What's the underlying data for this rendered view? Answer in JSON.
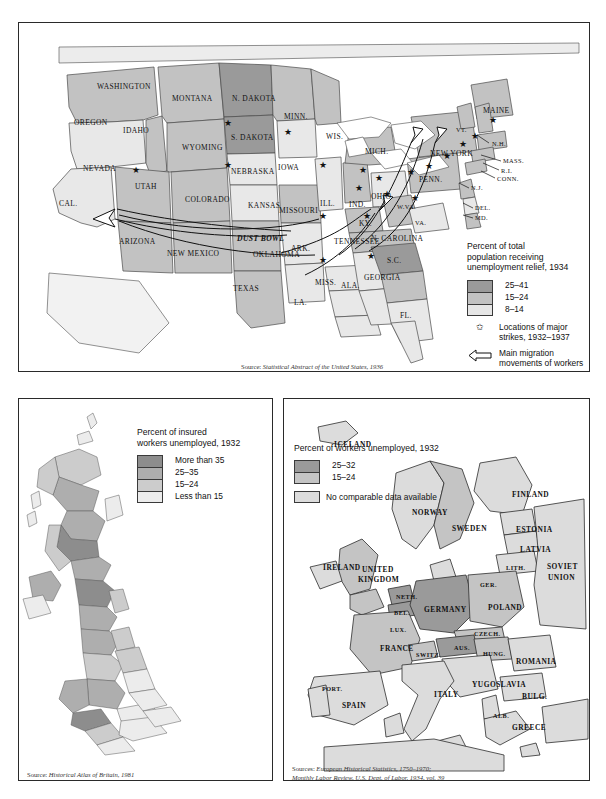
{
  "figure": {
    "panels": [
      "united-states-1934",
      "britain-1932",
      "europe-1932"
    ]
  },
  "us_map": {
    "legend": {
      "title": "Percent of total\npopulation receiving\nunemployment relief, 1934",
      "classes": [
        {
          "label": "25–41",
          "color": "#9a9a9a"
        },
        {
          "label": "15–24",
          "color": "#c2c2c2"
        },
        {
          "label": "8–14",
          "color": "#e6e6e6"
        }
      ],
      "symbols": [
        {
          "icon": "star-icon",
          "label": "Locations of major\nstrikes, 1932–1937"
        },
        {
          "icon": "arrow-icon",
          "label": "Main migration\nmovements of workers"
        }
      ]
    },
    "source_prefix": "Source: ",
    "source": "Statistical Abstract of the United States, 1936",
    "labels": [
      {
        "name": "WASHINGTON",
        "x": 78,
        "y": 60,
        "size": "n"
      },
      {
        "name": "OREGON",
        "x": 55,
        "y": 96,
        "size": "n"
      },
      {
        "name": "IDAHO",
        "x": 104,
        "y": 104,
        "size": "n"
      },
      {
        "name": "MONTANA",
        "x": 153,
        "y": 72,
        "size": "n"
      },
      {
        "name": "WYOMING",
        "x": 163,
        "y": 121,
        "size": "n"
      },
      {
        "name": "NEVADA",
        "x": 64,
        "y": 142,
        "size": "n"
      },
      {
        "name": "UTAH",
        "x": 116,
        "y": 160,
        "size": "n"
      },
      {
        "name": "COLORADO",
        "x": 166,
        "y": 173,
        "size": "n"
      },
      {
        "name": "CAL.",
        "x": 40,
        "y": 177,
        "size": "n"
      },
      {
        "name": "ARIZONA",
        "x": 100,
        "y": 215,
        "size": "n"
      },
      {
        "name": "NEW MEXICO",
        "x": 148,
        "y": 227,
        "size": "n"
      },
      {
        "name": "TEXAS",
        "x": 214,
        "y": 262,
        "size": "n"
      },
      {
        "name": "N. DAKOTA",
        "x": 213,
        "y": 72,
        "size": "n"
      },
      {
        "name": "S. DAKOTA",
        "x": 212,
        "y": 111,
        "size": "n"
      },
      {
        "name": "NEBRASKA",
        "x": 212,
        "y": 145,
        "size": "n"
      },
      {
        "name": "KANSAS",
        "x": 229,
        "y": 179,
        "size": "n"
      },
      {
        "name": "OKLAHOMA",
        "x": 234,
        "y": 228,
        "size": "n"
      },
      {
        "name": "MINN.",
        "x": 265,
        "y": 90,
        "size": "n"
      },
      {
        "name": "IOWA",
        "x": 259,
        "y": 141,
        "size": "n"
      },
      {
        "name": "MISSOURI",
        "x": 260,
        "y": 184,
        "size": "n"
      },
      {
        "name": "ARK.",
        "x": 272,
        "y": 222,
        "size": "n"
      },
      {
        "name": "LA.",
        "x": 275,
        "y": 276,
        "size": "n"
      },
      {
        "name": "MISS.",
        "x": 296,
        "y": 256,
        "size": "n"
      },
      {
        "name": "WIS.",
        "x": 307,
        "y": 110,
        "size": "n"
      },
      {
        "name": "ILL.",
        "x": 301,
        "y": 177,
        "size": "n"
      },
      {
        "name": "TENNESSEE",
        "x": 315,
        "y": 215,
        "size": "n"
      },
      {
        "name": "ALA.",
        "x": 322,
        "y": 259,
        "size": "n"
      },
      {
        "name": "MICH.",
        "x": 346,
        "y": 125,
        "size": "n"
      },
      {
        "name": "IND.",
        "x": 330,
        "y": 178,
        "size": "n"
      },
      {
        "name": "OHIO",
        "x": 352,
        "y": 170,
        "size": "n"
      },
      {
        "name": "KY.",
        "x": 340,
        "y": 197,
        "size": "n"
      },
      {
        "name": "GEORGIA",
        "x": 345,
        "y": 251,
        "size": "n"
      },
      {
        "name": "N. CAROLINA",
        "x": 352,
        "y": 212,
        "size": "n"
      },
      {
        "name": "S.C.",
        "x": 368,
        "y": 234,
        "size": "n"
      },
      {
        "name": "FL.",
        "x": 381,
        "y": 289,
        "size": "n"
      },
      {
        "name": "W.VA.",
        "x": 378,
        "y": 181,
        "size": "sm"
      },
      {
        "name": "VA.",
        "x": 396,
        "y": 197,
        "size": "sm"
      },
      {
        "name": "PENN.",
        "x": 400,
        "y": 153,
        "size": "n"
      },
      {
        "name": "NEW YORK",
        "x": 411,
        "y": 127,
        "size": "n"
      },
      {
        "name": "MAINE",
        "x": 464,
        "y": 84,
        "size": "n"
      },
      {
        "name": "VT.",
        "x": 437,
        "y": 104,
        "size": "sm"
      },
      {
        "name": "N.H.",
        "x": 473,
        "y": 118,
        "size": "sm"
      },
      {
        "name": "MASS.",
        "x": 484,
        "y": 135,
        "size": "sm"
      },
      {
        "name": "R.I.",
        "x": 482,
        "y": 145,
        "size": "sm"
      },
      {
        "name": "CONN.",
        "x": 478,
        "y": 153,
        "size": "sm"
      },
      {
        "name": "N.J.",
        "x": 452,
        "y": 162,
        "size": "sm"
      },
      {
        "name": "DEL.",
        "x": 456,
        "y": 182,
        "size": "sm"
      },
      {
        "name": "MD.",
        "x": 456,
        "y": 192,
        "size": "sm"
      },
      {
        "name": "DUST BOWL",
        "x": 218,
        "y": 212,
        "size": "dust"
      }
    ]
  },
  "uk_map": {
    "legend": {
      "title": "Percent of insured\nworkers unemployed, 1932",
      "classes": [
        {
          "label": "More than 35",
          "color": "#8d8d8d"
        },
        {
          "label": "25–35",
          "color": "#aeaeae"
        },
        {
          "label": "15–24",
          "color": "#cccccc"
        },
        {
          "label": "Less than 15",
          "color": "#ececec"
        }
      ]
    },
    "source_prefix": "Source: ",
    "source": "Historical Atlas of Britain, 1981"
  },
  "eu_map": {
    "legend": {
      "title": "Percent of workers unemployed, 1932",
      "classes": [
        {
          "label": "25–32",
          "color": "#9a9a9a"
        },
        {
          "label": "15–24",
          "color": "#c4c4c4"
        }
      ],
      "nodata": {
        "label": "No comparable data available",
        "color": "#dcdcdc"
      }
    },
    "source_prefix": "Sources: ",
    "source": "European Historical Statistics, 1750–1970;\n             Monthly Labor Review, U.S. Dept. of Labor, 1934, vol. 39",
    "labels": [
      {
        "name": "ICELAND",
        "x": 50,
        "y": 42,
        "size": "n"
      },
      {
        "name": "NORWAY",
        "x": 128,
        "y": 110,
        "size": "n"
      },
      {
        "name": "SWEDEN",
        "x": 168,
        "y": 126,
        "size": "n"
      },
      {
        "name": "FINLAND",
        "x": 228,
        "y": 92,
        "size": "n"
      },
      {
        "name": "ESTONIA",
        "x": 232,
        "y": 127,
        "size": "n"
      },
      {
        "name": "LATVIA",
        "x": 236,
        "y": 147,
        "size": "n"
      },
      {
        "name": "LITH.",
        "x": 222,
        "y": 166,
        "size": "sm"
      },
      {
        "name": "SOVIET",
        "x": 263,
        "y": 164,
        "size": "n"
      },
      {
        "name": "UNION",
        "x": 264,
        "y": 175,
        "size": "n"
      },
      {
        "name": "IRELAND",
        "x": 39,
        "y": 165,
        "size": "n"
      },
      {
        "name": "UNITED",
        "x": 78,
        "y": 167,
        "size": "n"
      },
      {
        "name": "KINGDOM",
        "x": 74,
        "y": 177,
        "size": "n"
      },
      {
        "name": "NETH.",
        "x": 112,
        "y": 195,
        "size": "sm"
      },
      {
        "name": "BEL.",
        "x": 110,
        "y": 211,
        "size": "sm"
      },
      {
        "name": "LUX.",
        "x": 106,
        "y": 228,
        "size": "sm"
      },
      {
        "name": "GER.",
        "x": 196,
        "y": 183,
        "size": "sm"
      },
      {
        "name": "GERMANY",
        "x": 140,
        "y": 207,
        "size": "n"
      },
      {
        "name": "POLAND",
        "x": 204,
        "y": 205,
        "size": "n"
      },
      {
        "name": "CZECH.",
        "x": 190,
        "y": 232,
        "size": "sm"
      },
      {
        "name": "FRANCE",
        "x": 96,
        "y": 246,
        "size": "n"
      },
      {
        "name": "SWITZ.",
        "x": 132,
        "y": 253,
        "size": "sm"
      },
      {
        "name": "AUS.",
        "x": 170,
        "y": 246,
        "size": "sm"
      },
      {
        "name": "HUNG.",
        "x": 199,
        "y": 252,
        "size": "sm"
      },
      {
        "name": "ROMANIA",
        "x": 232,
        "y": 259,
        "size": "n"
      },
      {
        "name": "YUGOSLAVIA",
        "x": 188,
        "y": 282,
        "size": "n"
      },
      {
        "name": "ITALY",
        "x": 150,
        "y": 292,
        "size": "n"
      },
      {
        "name": "BULG.",
        "x": 238,
        "y": 294,
        "size": "n"
      },
      {
        "name": "ALB.",
        "x": 209,
        "y": 314,
        "size": "sm"
      },
      {
        "name": "GREECE",
        "x": 228,
        "y": 325,
        "size": "n"
      },
      {
        "name": "PORT.",
        "x": 38,
        "y": 287,
        "size": "sm"
      },
      {
        "name": "SPAIN",
        "x": 58,
        "y": 303,
        "size": "n"
      }
    ]
  }
}
